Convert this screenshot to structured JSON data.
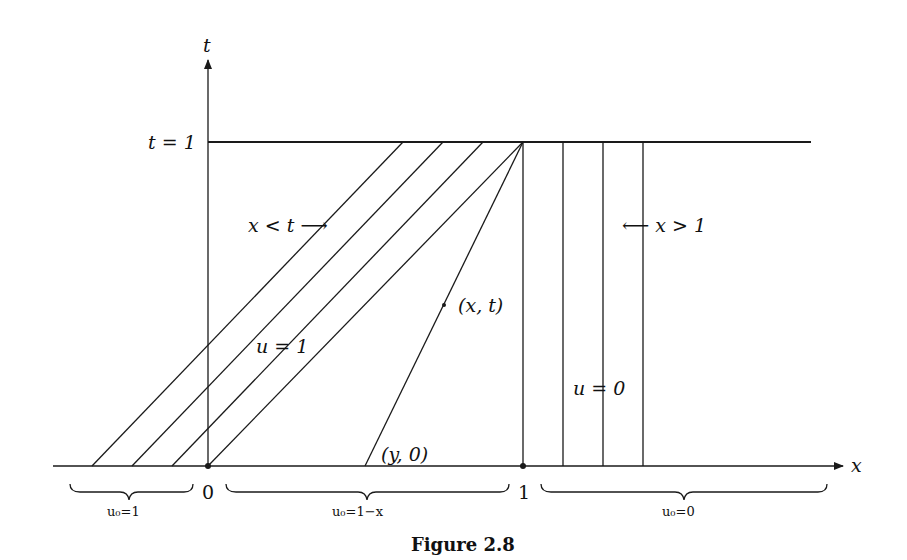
{
  "figure": {
    "caption": "Figure 2.8",
    "axes": {
      "x_label": "x",
      "t_label": "t",
      "t1_label": "t = 1",
      "origin_label": "0",
      "one_label": "1"
    },
    "regions": {
      "left_arrow_label": "x < t ⟶",
      "right_arrow_label": "⟵ x > 1",
      "u1_label": "u = 1",
      "u0_label": "u = 0",
      "point_xt_label": "(x, t)",
      "point_y0_label": "(y, 0)"
    },
    "braces": {
      "left": "u₀=1",
      "middle": "u₀=1−x",
      "right": "u₀=0"
    },
    "colors": {
      "ink": "#1a1a1a",
      "background": "#ffffff"
    }
  }
}
